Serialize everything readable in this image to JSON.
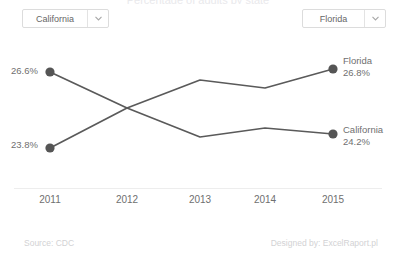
{
  "header": {
    "title_clipped": "Percentage of adults by state",
    "left_select": {
      "value": "California",
      "icon": "chevron-down-icon"
    },
    "right_select": {
      "value": "Florida",
      "icon": "chevron-down-icon"
    }
  },
  "labels": {
    "ca_start": "26.6%",
    "fl_start": "23.8%",
    "fl_end_name": "Florida",
    "fl_end_value": "26.8%",
    "ca_end_name": "California",
    "ca_end_value": "24.2%"
  },
  "footer": {
    "source": "Source: CDC",
    "credit": "Designed by: ExcelRaport.pl"
  },
  "colors": {
    "line": "#5a5a5a",
    "marker": "#555555",
    "axis": "#ededed",
    "text": "#6f6f6f",
    "footer_text": "#d2d2d4",
    "border": "#dcdcdc"
  },
  "chart_data": {
    "type": "line",
    "title": "",
    "xlabel": "",
    "ylabel": "",
    "x": [
      "2011",
      "2012",
      "2013",
      "2014",
      "2015"
    ],
    "categories": [
      "2011",
      "2012",
      "2013",
      "2014",
      "2015"
    ],
    "ylim": [
      23.0,
      27.4
    ],
    "grid": false,
    "legend": "inline-endpoint-labels",
    "markers": "endpoints-only",
    "series": [
      {
        "name": "California",
        "values": [
          26.6,
          25.2,
          24.0,
          24.4,
          24.2
        ],
        "start_label": "26.6%",
        "end_label": "24.2%"
      },
      {
        "name": "Florida",
        "values": [
          23.8,
          25.2,
          26.5,
          26.2,
          26.8
        ],
        "start_label": "23.8%",
        "end_label": "26.8%"
      }
    ]
  }
}
